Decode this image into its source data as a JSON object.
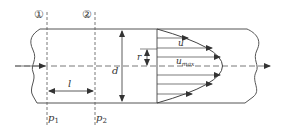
{
  "diagram": {
    "sections": [
      {
        "marker": "①",
        "pressure_label": "p",
        "pressure_sub": "1"
      },
      {
        "marker": "②",
        "pressure_label": "p",
        "pressure_sub": "2"
      }
    ],
    "labels": {
      "length": "l",
      "diameter": "d",
      "radius": "r",
      "velocity": "u",
      "velocity_max": "u",
      "velocity_max_sub": "max"
    },
    "colors": {
      "stroke": "#4a4a4a",
      "background": "#ffffff"
    }
  }
}
